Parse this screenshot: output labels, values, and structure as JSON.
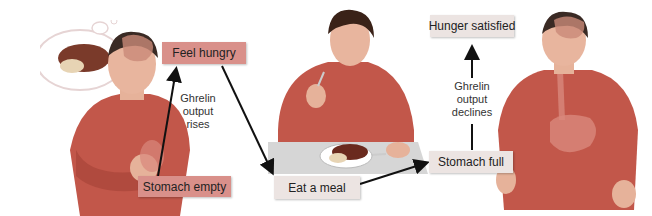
{
  "diagram": {
    "nodes": {
      "feel_hungry": "Feel hungry",
      "stomach_empty": "Stomach empty",
      "eat_a_meal": "Eat a meal",
      "stomach_full": "Stomach full",
      "hunger_satisfied": "Hunger satisfied"
    },
    "annotations": {
      "rises": [
        "Ghrelin",
        "output",
        "rises"
      ],
      "declines": [
        "Ghrelin",
        "output",
        "declines"
      ]
    },
    "colors": {
      "hunger_box": "#d9908a",
      "neutral_box": "#ece4e2",
      "shirt": "#c2574a",
      "arrow": "#111111"
    },
    "figures": [
      "hungry-person-with-thought-bubble",
      "person-eating-meal",
      "satisfied-person-with-full-stomach"
    ]
  }
}
